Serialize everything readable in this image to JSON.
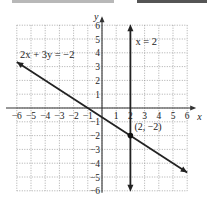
{
  "chart_data": {
    "type": "line",
    "title": "",
    "xlabel": "x",
    "ylabel": "y",
    "xlim": [
      -6,
      6
    ],
    "ylim": [
      -6,
      6
    ],
    "grid": true,
    "x_ticks": [
      "-6",
      "-5",
      "-4",
      "-3",
      "-2",
      "-1",
      "1",
      "2",
      "3",
      "4",
      "5",
      "6"
    ],
    "y_ticks": [
      "6",
      "5",
      "4",
      "3",
      "2",
      "1",
      "-1",
      "-2",
      "-3",
      "-4",
      "-5",
      "-6"
    ],
    "series": [
      {
        "name": "2x + 3y = -2",
        "points": [
          [
            -6,
            3.33
          ],
          [
            6,
            -4.67
          ]
        ]
      },
      {
        "name": "x = 2",
        "points": [
          [
            2,
            6
          ],
          [
            2,
            -6
          ]
        ]
      }
    ],
    "annotations": [
      {
        "text": "2x + 3y = −2",
        "x": -5.8,
        "y": 3.6
      },
      {
        "text": "x = 2",
        "x": 2.3,
        "y": 4.6
      },
      {
        "text": "(2, −2)",
        "x": 2.3,
        "y": -1.6,
        "point": [
          2,
          -2
        ]
      }
    ]
  },
  "labels": {
    "x_axis": "x",
    "y_axis": "y",
    "line1": "2x + 3y = −2",
    "line2": "x = 2",
    "intersection": "(2, −2)"
  }
}
